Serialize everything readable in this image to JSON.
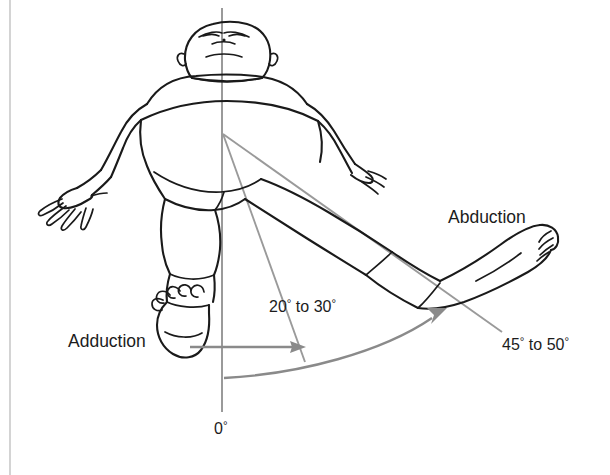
{
  "figure": {
    "kind": "anatomical-line-drawing",
    "background_color": "#ffffff",
    "ink_color": "#1a1a1a",
    "guide_color": "#9a9a9a",
    "arrow_color": "#8a8a8a",
    "border_color": "#c9c9c9"
  },
  "labels": {
    "abduction": "Abduction",
    "adduction": "Adduction",
    "angle_small_value": "20",
    "angle_small_connector": " to ",
    "angle_small_value2": "30",
    "angle_large_value": "45",
    "angle_large_connector": " to ",
    "angle_large_value2": "50",
    "zero_value": "0",
    "degree_symbol": "°"
  },
  "measurements": {
    "neutral_reference_degrees": 0,
    "adduction_range": {
      "min_degrees": 20,
      "max_degrees": 30,
      "text": "20° to 30°"
    },
    "abduction_range": {
      "min_degrees": 45,
      "max_degrees": 50,
      "text": "45° to 50°"
    },
    "zero_reference_text": "0°"
  },
  "annotations": {
    "vertical_axis_name": "midline-zero-degree-reference",
    "guide_line_small_name": "twenty-to-thirty-degree-guide",
    "guide_line_large_name": "fortyfive-to-fifty-degree-guide",
    "straight_arrow_name": "adduction-direction-arrow",
    "curved_arrow_name": "abduction-sweep-arrow"
  }
}
